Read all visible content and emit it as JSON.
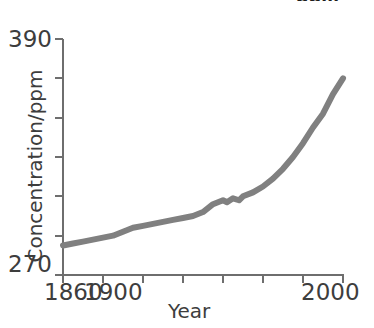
{
  "figure": {
    "title_remnant": "ppm",
    "background_color": "#ffffff"
  },
  "axes": {
    "y_label": "Concentration/ppm",
    "x_label": "Year",
    "y_tick_top": "390",
    "y_tick_bottom": "270",
    "x_tick_first": "1860",
    "x_tick_second": "1900",
    "x_tick_last": "2000"
  },
  "chart_data": {
    "type": "line",
    "title": "",
    "subtitle": "",
    "xlabel": "Year",
    "ylabel": "Concentration/ppm",
    "xlim": [
      1860,
      2000
    ],
    "ylim": [
      270,
      390
    ],
    "x_ticks": [
      1860,
      1880,
      1900,
      1920,
      1940,
      1960,
      1980,
      2000
    ],
    "x_tick_labels": [
      "1860",
      "",
      "1900",
      "",
      "",
      "",
      "",
      "2000"
    ],
    "y_ticks": [
      270,
      290,
      310,
      330,
      350,
      370,
      390
    ],
    "y_tick_labels": [
      "270",
      "",
      "",
      "",
      "",
      "",
      "390"
    ],
    "grid": false,
    "legend": null,
    "line_color": "#808080",
    "line_width": 6,
    "series": [
      {
        "name": "CO2 concentration",
        "x": [
          1860,
          1865,
          1870,
          1875,
          1880,
          1885,
          1890,
          1895,
          1900,
          1905,
          1910,
          1915,
          1920,
          1925,
          1930,
          1935,
          1940,
          1942,
          1945,
          1948,
          1950,
          1955,
          1960,
          1965,
          1970,
          1975,
          1980,
          1985,
          1990,
          1995,
          2000
        ],
        "y": [
          285,
          286,
          287,
          288,
          289,
          290,
          292,
          294,
          295,
          296,
          297,
          298,
          299,
          300,
          302,
          306,
          308,
          307,
          309,
          308,
          310,
          312,
          315,
          319,
          324,
          330,
          337,
          345,
          352,
          362,
          370
        ]
      }
    ]
  }
}
